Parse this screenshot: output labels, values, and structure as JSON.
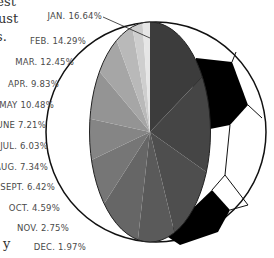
{
  "text_fragments": [
    "gest",
    "ust",
    "s.",
    "y"
  ],
  "chart_data": {
    "type": "pie",
    "title": "",
    "style": "elliptical pie overlaid on soccer ball illustration",
    "categories": [
      "JAN.",
      "FEB.",
      "MAR.",
      "APR.",
      "MAY",
      "JUNE",
      "JUL.",
      "AUG.",
      "SEPT.",
      "OCT.",
      "NOV.",
      "DEC."
    ],
    "values": [
      16.64,
      14.29,
      12.45,
      9.83,
      10.48,
      7.21,
      6.03,
      7.34,
      6.42,
      4.59,
      2.75,
      1.97
    ],
    "labels": [
      "JAN. 16.64%",
      "FEB. 14.29%",
      "MAR. 12.45%",
      "APR. 9.83%",
      "MAY 10.48%",
      "JUNE 7.21%",
      "JUL. 6.03%",
      "AUG. 7.34%",
      "SEPT. 6.42%",
      "OCT. 4.59%",
      "NOV. 2.75%",
      "DEC. 1.97%"
    ],
    "colors": [
      "#3c3c3c",
      "#454545",
      "#4e4e4e",
      "#5a5a5a",
      "#666666",
      "#767676",
      "#858585",
      "#949494",
      "#a6a6a6",
      "#b9b9b9",
      "#cecece",
      "#e6e6e6"
    ],
    "direction": "clockwise from top",
    "legend": "none; labels stacked on left"
  }
}
